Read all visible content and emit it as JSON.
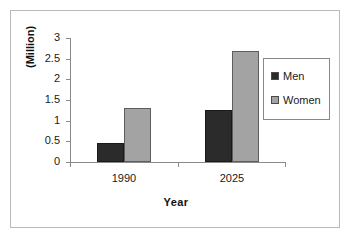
{
  "chart_data": {
    "type": "bar",
    "title": "",
    "categories": [
      "1990",
      "2025"
    ],
    "series": [
      {
        "name": "Men",
        "values": [
          0.45,
          1.25
        ],
        "color": "#2b2b2b"
      },
      {
        "name": "Women",
        "values": [
          1.3,
          2.68
        ],
        "color": "#a3a3a3"
      }
    ],
    "xlabel": "Year",
    "ylabel": "(Million)",
    "ylim": [
      0,
      3
    ],
    "ytick_labels": [
      "0",
      "0.5",
      "1",
      "1.5",
      "2",
      "2.5",
      "3"
    ],
    "ytick_values": [
      0,
      0.5,
      1,
      1.5,
      2,
      2.5,
      3
    ],
    "grid": false,
    "legend_position": "right",
    "legend_entries": [
      "Men",
      "Women"
    ]
  },
  "axes": {
    "y_title": "(Million)",
    "x_title": "Year",
    "ticks": [
      {
        "label": "3"
      },
      {
        "label": "2.5"
      },
      {
        "label": "2"
      },
      {
        "label": "1.5"
      },
      {
        "label": "1"
      },
      {
        "label": "0.5"
      },
      {
        "label": "0"
      }
    ],
    "categories": [
      {
        "label": "1990"
      },
      {
        "label": "2025"
      }
    ]
  },
  "legend": {
    "entries": [
      {
        "label": "Men"
      },
      {
        "label": "Women"
      }
    ]
  }
}
